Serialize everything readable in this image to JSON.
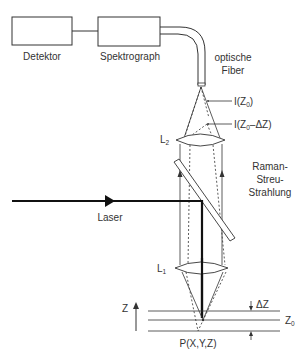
{
  "diagram": {
    "components": {
      "detector": {
        "label": "Detektor"
      },
      "spectrograph": {
        "label": "Spektrograph"
      },
      "fiber": {
        "label_line1": "optische",
        "label_line2": "Fiber"
      },
      "lens_top": {
        "label": "L",
        "subscript": "2"
      },
      "lens_bottom": {
        "label": "L",
        "subscript": "1"
      },
      "laser": {
        "label": "Laser"
      },
      "raman": {
        "line1": "Raman-",
        "line2": "Streu-",
        "line3": "Strahlung"
      }
    },
    "intensities": {
      "focus": {
        "prefix": "I(Z",
        "subscript": "0",
        "suffix": ")"
      },
      "defocus": {
        "prefix": "I(Z",
        "subscript": "0",
        "suffix": "–ΔZ)"
      }
    },
    "sample": {
      "axis_label": "Z",
      "delta_label": "ΔZ",
      "z0_label": "Z",
      "z0_subscript": "0",
      "point_label": "P(X,Y,Z)"
    },
    "colors": {
      "line": "#333333",
      "laser": "#111111",
      "background": "#ffffff"
    }
  }
}
